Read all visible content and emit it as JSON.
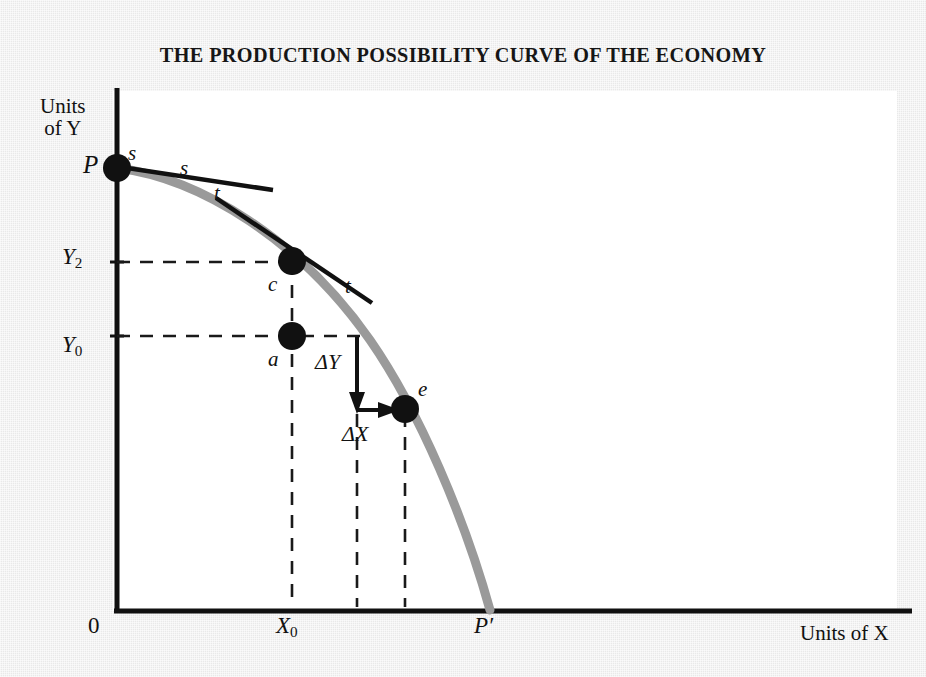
{
  "figure": {
    "title": "THE PRODUCTION POSSIBILITY CURVE OF THE ECONOMY",
    "axes": {
      "y_axis_label": "Units of Y",
      "x_axis_label": "Units of X",
      "origin_label": "0"
    },
    "y_ticks": [
      {
        "label_main": "Y",
        "label_sub": "2"
      },
      {
        "label_main": "Y",
        "label_sub": "0"
      }
    ],
    "x_ticks": [
      {
        "label_main": "X",
        "label_sub": "0"
      }
    ],
    "points": [
      {
        "id": "P",
        "label": "P"
      },
      {
        "id": "c",
        "label": "c"
      },
      {
        "id": "a",
        "label": "a"
      },
      {
        "id": "e",
        "label": "e"
      },
      {
        "id": "Pprime",
        "label": "P′"
      }
    ],
    "tangent_s": {
      "label_left": "s",
      "label_right": "s"
    },
    "tangent_t": {
      "label_left": "t",
      "label_right": "t"
    },
    "deltas": {
      "delta_y": "ΔY",
      "delta_x": "ΔX"
    },
    "colors": {
      "page_background": "#e9e9e9",
      "plot_background": "#ffffff",
      "axis": "#111111",
      "curve": "#9a9a9a",
      "tangent": "#111111",
      "point": "#111111",
      "dashed_guide": "#1a1a1a"
    }
  },
  "chart_data": {
    "type": "line",
    "title": "THE PRODUCTION POSSIBILITY CURVE OF THE ECONOMY",
    "xlabel": "Units of X",
    "ylabel": "Units of Y",
    "grid": false,
    "legend": "none",
    "xlim": [
      0,
      100
    ],
    "ylim": [
      0,
      100
    ],
    "series": [
      {
        "name": "Production Possibility Curve",
        "comment": "Concave-to-origin frontier from P on the Y axis to P' on the X axis",
        "x": [
          0,
          5,
          12,
          20,
          28,
          36,
          44,
          52,
          60,
          68,
          76,
          84,
          92,
          97,
          100
        ],
        "y": [
          100,
          99,
          97,
          93,
          88,
          81,
          73,
          64,
          55,
          45,
          35,
          24,
          12,
          5,
          0
        ]
      }
    ],
    "annotations": [
      {
        "label": "P",
        "x": 0,
        "y": 100,
        "note": "maximum output of Y, zero X"
      },
      {
        "label": "c",
        "x": 27,
        "y": 80,
        "note": "efficient point on the frontier at X0"
      },
      {
        "label": "a",
        "x": 27,
        "y": 59,
        "note": "inefficient point inside the frontier at X0"
      },
      {
        "label": "e",
        "x": 48,
        "y": 38,
        "note": "efficient point reached after trading off dY for dX"
      },
      {
        "label": "P′",
        "x": 100,
        "y": 0,
        "note": "maximum output of X, zero Y"
      }
    ],
    "tangents": [
      {
        "label": "s",
        "at_point": "P",
        "note": "tangent ss drawn at point P, nearly flat"
      },
      {
        "label": "t",
        "at_point": "c",
        "note": "tangent tt drawn at point c, slope = marginal rate of transformation"
      }
    ],
    "measures": [
      {
        "label": "ΔY",
        "from_y": 59,
        "to_y": 38,
        "at_x": 38,
        "note": "fall in Y output"
      },
      {
        "label": "ΔX",
        "from_x": 38,
        "to_x": 48,
        "at_y": 38,
        "note": "rise in X output"
      }
    ],
    "ticks": {
      "y": [
        {
          "label": "Y2",
          "value": 80
        },
        {
          "label": "Y0",
          "value": 59
        }
      ],
      "x": [
        {
          "label": "X0",
          "value": 27
        }
      ]
    }
  }
}
